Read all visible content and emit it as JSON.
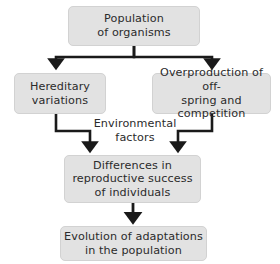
{
  "diagram": {
    "background_color": "#ffffff",
    "node_fill_color": "#e2e2e2",
    "node_border_color": "#d2d2d2",
    "connector_color": "#1a1a1a",
    "text_color": "#2b2b2b",
    "nodes": [
      {
        "id": "population",
        "label": "Population\nof organisms"
      },
      {
        "id": "hereditary",
        "label": "Hereditary\nvariations"
      },
      {
        "id": "overproduction",
        "label": "Overproduction of off-\nspring and competition"
      },
      {
        "id": "differences",
        "label": "Differences in\nreproductive success\nof individuals"
      },
      {
        "id": "evolution",
        "label": "Evolution of adaptations\nin the population"
      }
    ],
    "labels": [
      {
        "id": "environmental",
        "label": "Environmental\nfactors"
      }
    ],
    "connectors": [
      {
        "id": "population-to-hereditary",
        "from": "population",
        "to": "hereditary",
        "style": "elbow-split-left"
      },
      {
        "id": "population-to-overproduction",
        "from": "population",
        "to": "overproduction",
        "style": "elbow-split-right"
      },
      {
        "id": "hereditary-to-differences",
        "from": "hereditary",
        "to": "differences",
        "style": "elbow-merge-right"
      },
      {
        "id": "overproduction-to-differences",
        "from": "overproduction",
        "to": "differences",
        "style": "elbow-merge-left"
      },
      {
        "id": "differences-to-evolution",
        "from": "differences",
        "to": "evolution",
        "style": "straight-down"
      }
    ]
  }
}
